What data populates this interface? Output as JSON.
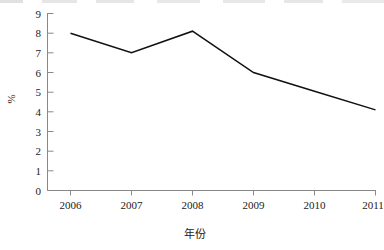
{
  "chart_data": {
    "type": "line",
    "title": "",
    "subtitle": "",
    "xlabel": "年份",
    "ylabel": "%",
    "categories": [
      "2006",
      "2007",
      "2008",
      "2009",
      "2010",
      "2011"
    ],
    "x": [
      2006,
      2007,
      2008,
      2009,
      2010,
      2011
    ],
    "values": [
      8.0,
      7.0,
      8.1,
      6.0,
      5.05,
      4.1
    ],
    "series": [
      {
        "name": "",
        "values": [
          8.0,
          7.0,
          8.1,
          6.0,
          5.05,
          4.1
        ]
      }
    ],
    "xlim": [
      2006,
      2011
    ],
    "ylim": [
      0,
      9
    ],
    "ytick_labels": [
      "0",
      "1",
      "2",
      "3",
      "4",
      "5",
      "6",
      "7",
      "8",
      "9"
    ],
    "ytick_values": [
      0,
      1,
      2,
      3,
      4,
      5,
      6,
      7,
      8,
      9
    ],
    "xtick_labels": [
      "2006",
      "2007",
      "2008",
      "2009",
      "2010",
      "2011"
    ],
    "grid": false,
    "legend": false,
    "legend_position": "none",
    "line_color": "#111111",
    "axis_color": "#777777",
    "background_color": "#ffffff",
    "annotations": []
  },
  "axes": {
    "y_title": "%",
    "x_title": "年份",
    "y_ticks": [
      "9",
      "8",
      "7",
      "6",
      "5",
      "4",
      "3",
      "2",
      "1",
      "0"
    ],
    "x_ticks": [
      "2006",
      "2007",
      "2008",
      "2009",
      "2010",
      "2011"
    ]
  }
}
